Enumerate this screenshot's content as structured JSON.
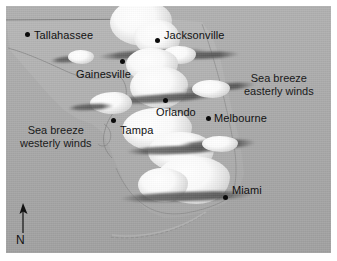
{
  "figure": {
    "kind": "satellite-map",
    "region": "Florida peninsula",
    "palette": {
      "sea": "#a9a9a9",
      "land": "#b4b4b4",
      "cloud": "#ffffff",
      "cloud_shadow": "#585858",
      "text": "#111111",
      "marker": "#0b0b0b",
      "page_background": "#ffffff"
    }
  },
  "cities": [
    {
      "name": "Tallahassee",
      "label_x": 28,
      "label_y": 23,
      "dot_x": 19,
      "dot_y": 26
    },
    {
      "name": "Jacksonville",
      "label_x": 158,
      "label_y": 23,
      "dot_x": 149,
      "dot_y": 32
    },
    {
      "name": "Gainesville",
      "label_x": 70,
      "label_y": 62,
      "dot_x": 114,
      "dot_y": 53
    },
    {
      "name": "Orlando",
      "label_x": 168,
      "label_y": 100,
      "dot_x": 157,
      "dot_y": 92
    },
    {
      "name": "Melbourne",
      "label_x": 208,
      "label_y": 108,
      "dot_x": 200,
      "dot_y": 110
    },
    {
      "name": "Tampa",
      "label_x": 114,
      "label_y": 120,
      "dot_x": 105,
      "dot_y": 112
    },
    {
      "name": "Miami",
      "label_x": 228,
      "label_y": 180,
      "dot_x": 217,
      "dot_y": 189
    }
  ],
  "annotations": [
    {
      "id": "sea-breeze-easterly",
      "line1": "Sea breeze",
      "line2": "easterly winds",
      "x": 245,
      "y": 70
    },
    {
      "id": "sea-breeze-westerly",
      "line1": "Sea breeze",
      "line2": "westerly winds",
      "x": 18,
      "y": 122
    }
  ],
  "compass": {
    "label": "N",
    "direction": "north"
  }
}
